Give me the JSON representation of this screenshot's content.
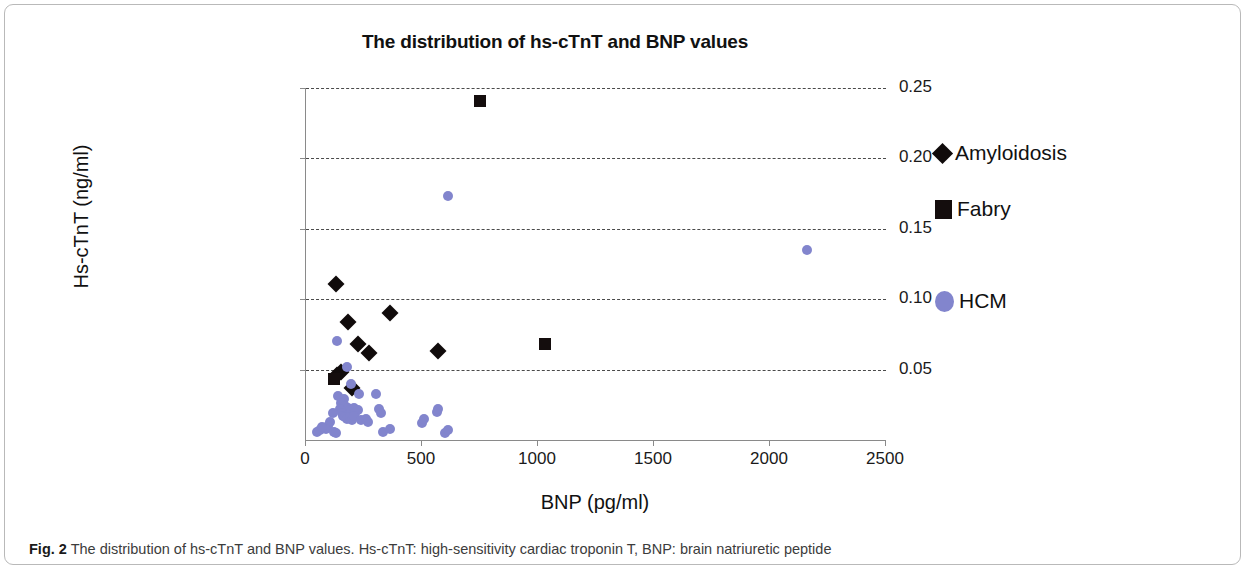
{
  "figure": {
    "number_label": "Fig. 2",
    "caption": "The distribution of hs-cTnT and BNP values. Hs-cTnT: high-sensitivity cardiac troponin T, BNP: brain natriuretic peptide"
  },
  "legend": {
    "position": "right",
    "entries": [
      {
        "label": "Amyloidosis",
        "marker": "diamond",
        "color": "#100b0b"
      },
      {
        "label": "Fabry",
        "marker": "square",
        "color": "#140d0d"
      },
      {
        "label": "HCM",
        "marker": "circle",
        "color": "#8285cd"
      }
    ]
  },
  "chart_data": {
    "type": "scatter",
    "title": "The distribution of hs-cTnT and BNP values",
    "xlabel": "BNP (pg/ml)",
    "ylabel": "Hs-cTnT (ng/ml)",
    "xlim": [
      0,
      2500
    ],
    "ylim": [
      0,
      0.25
    ],
    "xticks": [
      0,
      500,
      1000,
      1500,
      2000,
      2500
    ],
    "xtick_labels": [
      "0",
      "500",
      "1000",
      "1500",
      "2000",
      "2500"
    ],
    "yticks": [
      0.05,
      0.1,
      0.15,
      0.2,
      0.25
    ],
    "ytick_labels": [
      "0.05",
      "0.10",
      "0.15",
      "0.20",
      "0.25"
    ],
    "grid": "horizontal-dashed",
    "series": [
      {
        "name": "Amyloidosis",
        "marker": "diamond",
        "color": "#100b0b",
        "points": [
          [
            130,
            0.111
          ],
          [
            180,
            0.084
          ],
          [
            225,
            0.068
          ],
          [
            360,
            0.09
          ],
          [
            270,
            0.062
          ],
          [
            570,
            0.063
          ],
          [
            133,
            0.046
          ],
          [
            152,
            0.048
          ],
          [
            198,
            0.037
          ]
        ]
      },
      {
        "name": "Fabry",
        "marker": "square",
        "color": "#140d0d",
        "points": [
          [
            750,
            0.241
          ],
          [
            1030,
            0.068
          ],
          [
            120,
            0.043
          ]
        ]
      },
      {
        "name": "HCM",
        "marker": "circle",
        "color": "#8285cd",
        "points": [
          [
            610,
            0.173
          ],
          [
            2160,
            0.135
          ],
          [
            133,
            0.07
          ],
          [
            175,
            0.052
          ],
          [
            196,
            0.04
          ],
          [
            230,
            0.033
          ],
          [
            140,
            0.031
          ],
          [
            162,
            0.029
          ],
          [
            152,
            0.026
          ],
          [
            170,
            0.024
          ],
          [
            175,
            0.022
          ],
          [
            182,
            0.023
          ],
          [
            188,
            0.021
          ],
          [
            196,
            0.02
          ],
          [
            205,
            0.023
          ],
          [
            213,
            0.019
          ],
          [
            222,
            0.021
          ],
          [
            148,
            0.022
          ],
          [
            155,
            0.019
          ],
          [
            160,
            0.017
          ],
          [
            168,
            0.016
          ],
          [
            178,
            0.015
          ],
          [
            190,
            0.016
          ],
          [
            200,
            0.014
          ],
          [
            208,
            0.017
          ],
          [
            236,
            0.014
          ],
          [
            258,
            0.015
          ],
          [
            268,
            0.013
          ],
          [
            115,
            0.019
          ],
          [
            104,
            0.013
          ],
          [
            96,
            0.01
          ],
          [
            86,
            0.008
          ],
          [
            60,
            0.007
          ],
          [
            48,
            0.006
          ],
          [
            70,
            0.009
          ],
          [
            120,
            0.006
          ],
          [
            128,
            0.005
          ],
          [
            300,
            0.033
          ],
          [
            316,
            0.022
          ],
          [
            322,
            0.019
          ],
          [
            330,
            0.006
          ],
          [
            360,
            0.008
          ],
          [
            500,
            0.012
          ],
          [
            508,
            0.015
          ],
          [
            565,
            0.02
          ],
          [
            570,
            0.022
          ],
          [
            600,
            0.005
          ],
          [
            610,
            0.007
          ]
        ]
      }
    ]
  }
}
